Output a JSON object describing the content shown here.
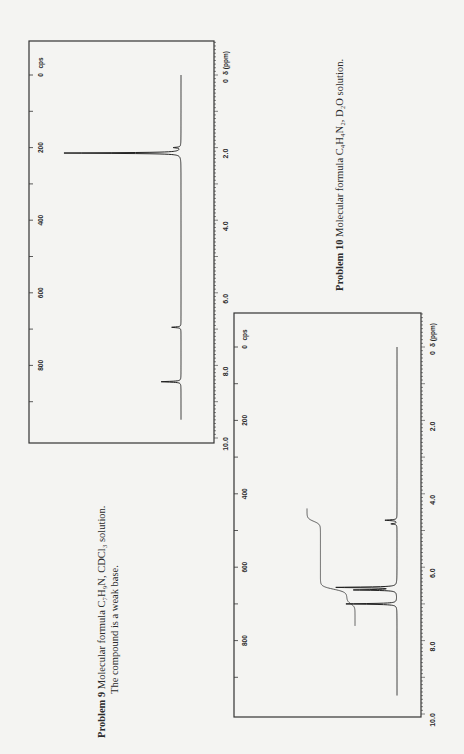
{
  "page": {
    "orientation": "rotated 90 degrees counter-clockwise"
  },
  "captions": {
    "problem9": {
      "label": "Problem 9",
      "line1": "Molecular formula C₇H₉N, CDCl₃ solution.",
      "line2": "The compound is a weak base."
    },
    "problem10": {
      "label": "Problem 10",
      "line1": "Molecular formula C₄H₄N₂, D₂O solution."
    }
  },
  "chart_data": [
    {
      "id": "problem9",
      "type": "line",
      "title": "Problem 9 ¹H NMR spectrum",
      "xlabel": "δ (ppm)",
      "ylabel": "",
      "x_axis_unit_label": "δ (ppm)",
      "cps_axis_unit_label": "cps",
      "xlim": [
        10.0,
        0
      ],
      "ppm_ticks": [
        "10.0",
        "8.0",
        "6.0",
        "4.0",
        "2.0",
        "0"
      ],
      "cps_ticks": [
        "800",
        "600",
        "400",
        "200",
        "0"
      ],
      "grid": false,
      "series": [
        {
          "name": "spectrum",
          "peaks": [
            {
              "ppm": 0.0,
              "height": 0.0
            },
            {
              "ppm": 2.0,
              "height": 0.06
            },
            {
              "ppm": 2.15,
              "height": 1.0
            },
            {
              "ppm": 6.95,
              "height": 0.08
            },
            {
              "ppm": 8.45,
              "height": 0.17
            }
          ],
          "trace_range_ppm": [
            0.0,
            9.5
          ]
        }
      ]
    },
    {
      "id": "problem10",
      "type": "line",
      "title": "Problem 10 ¹H NMR spectrum",
      "xlabel": "δ (ppm)",
      "ylabel": "",
      "x_axis_unit_label": "δ (ppm)",
      "cps_axis_unit_label": "cps",
      "xlim": [
        10.0,
        0
      ],
      "ppm_ticks": [
        "10.0",
        "8.0",
        "6.0",
        "4.0",
        "2.0",
        "0"
      ],
      "cps_ticks": [
        "800",
        "600",
        "400",
        "200",
        "0"
      ],
      "grid": false,
      "series": [
        {
          "name": "spectrum",
          "peaks": [
            {
              "ppm": 4.72,
              "height": 0.2
            },
            {
              "ppm": 4.82,
              "height": 0.1
            },
            {
              "ppm": 6.55,
              "height": 1.0
            },
            {
              "ppm": 6.62,
              "height": 0.7
            },
            {
              "ppm": 7.0,
              "height": 0.85
            }
          ],
          "trace_range_ppm": [
            0.0,
            9.5
          ]
        },
        {
          "name": "integral",
          "steps": [
            {
              "ppm": 4.75,
              "rise": 0.28
            },
            {
              "ppm": 6.6,
              "rise": 0.55
            },
            {
              "ppm": 7.0,
              "rise": 0.17
            }
          ],
          "range_ppm": [
            4.4,
            7.6
          ]
        }
      ]
    }
  ]
}
